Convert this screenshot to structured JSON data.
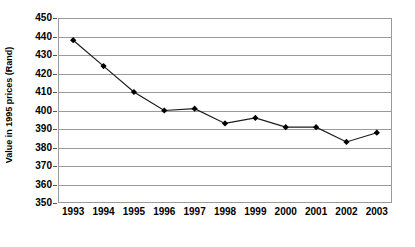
{
  "chart_data": {
    "type": "line",
    "title": "",
    "xlabel": "",
    "ylabel": "Value in 1995 prices (Rand)",
    "categories": [
      "1993",
      "1994",
      "1995",
      "1996",
      "1997",
      "1998",
      "1999",
      "2000",
      "2001",
      "2002",
      "2003"
    ],
    "values": [
      438,
      424,
      410,
      400,
      401,
      393,
      396,
      391,
      391,
      383,
      388
    ],
    "series": [
      {
        "name": "Value in 1995 prices (Rand)",
        "values": [
          438,
          424,
          410,
          400,
          401,
          393,
          396,
          391,
          391,
          383,
          388
        ]
      }
    ],
    "ylim": [
      350,
      450
    ],
    "yticks": [
      350,
      360,
      370,
      380,
      390,
      400,
      410,
      420,
      430,
      440,
      450
    ],
    "ytick_labels": [
      "350",
      "360",
      "370",
      "380",
      "390",
      "400",
      "410",
      "420",
      "430",
      "440",
      "450"
    ],
    "grid": "horizontal",
    "legend": "none",
    "marker": "diamond",
    "line_color": "#1a1a1a",
    "marker_color": "#000000",
    "grid_color": "#9a9a9a",
    "background": "#ffffff"
  }
}
